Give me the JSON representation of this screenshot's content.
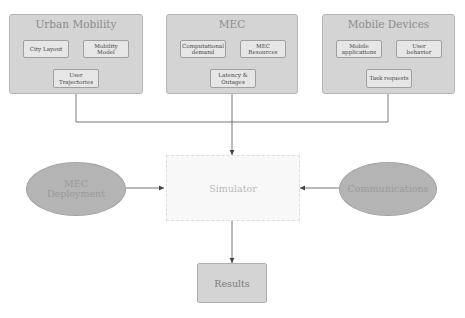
{
  "groups": [
    {
      "title": "Urban Mobility",
      "items": [
        {
          "label": "City Layout"
        },
        {
          "label": "Mobility Model"
        },
        {
          "label": "User Trajectories"
        }
      ]
    },
    {
      "title": "MEC",
      "items": [
        {
          "label": "Computational demand"
        },
        {
          "label": "MEC Resources"
        },
        {
          "label": "Latency & Outages"
        }
      ]
    },
    {
      "title": "Mobile Devices",
      "items": [
        {
          "label": "Mobile applications"
        },
        {
          "label": "User behavior"
        },
        {
          "label": "Task requests"
        }
      ]
    }
  ],
  "inputs": {
    "left": {
      "label": "MEC Deployment"
    },
    "right": {
      "label": "Communications"
    }
  },
  "simulator": {
    "label": "Simulator"
  },
  "results": {
    "label": "Results"
  },
  "colors": {
    "group_fill": "#d4d4d4",
    "sub_fill": "#e6e6e6",
    "ellipse_fill": "#b4b4b4",
    "simulator_fill": "#f8f8f8",
    "line": "#555555"
  }
}
